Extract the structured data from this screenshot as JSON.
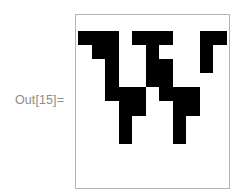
{
  "output": {
    "label": "Out[15]=",
    "label_color": "#8c8c8c"
  },
  "plot": {
    "type": "ArrayPlot",
    "frame_color": "#b4b4b4",
    "on_color": "#000000",
    "off_color": "#ffffff",
    "rows": 11,
    "cols": 11,
    "cells": [
      [
        1,
        1,
        1,
        0,
        1,
        1,
        1,
        0,
        0,
        1,
        1
      ],
      [
        0,
        1,
        1,
        0,
        0,
        1,
        0,
        0,
        0,
        1,
        0
      ],
      [
        0,
        0,
        1,
        0,
        0,
        1,
        1,
        0,
        0,
        1,
        0
      ],
      [
        0,
        0,
        1,
        0,
        0,
        1,
        1,
        0,
        0,
        0,
        0
      ],
      [
        0,
        0,
        1,
        1,
        1,
        0,
        1,
        1,
        1,
        0,
        0
      ],
      [
        0,
        0,
        0,
        1,
        1,
        0,
        0,
        1,
        1,
        0,
        0
      ],
      [
        0,
        0,
        0,
        1,
        0,
        0,
        0,
        1,
        0,
        0,
        0
      ],
      [
        0,
        0,
        0,
        1,
        0,
        0,
        0,
        1,
        0,
        0,
        0
      ],
      [
        0,
        0,
        0,
        0,
        0,
        0,
        0,
        0,
        0,
        0,
        0
      ],
      [
        0,
        0,
        0,
        0,
        0,
        0,
        0,
        0,
        0,
        0,
        0
      ],
      [
        0,
        0,
        0,
        0,
        0,
        0,
        0,
        0,
        0,
        0,
        0
      ]
    ]
  }
}
